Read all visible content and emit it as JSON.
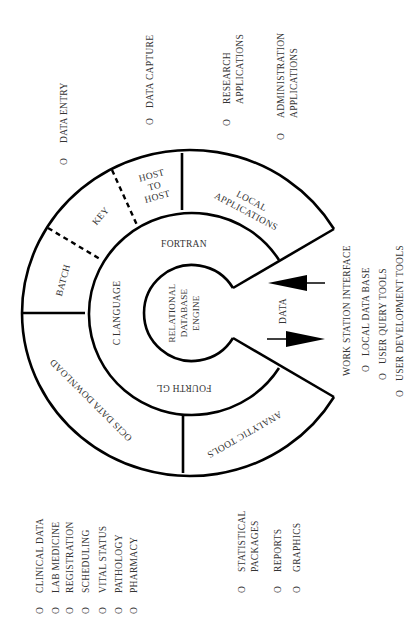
{
  "diagram": {
    "core": {
      "lines": [
        "RELATIONAL",
        "DATABASE",
        "ENGINE"
      ]
    },
    "middle_ring": {
      "fortran": "FORTRAN",
      "c_language": "C LANGUAGE",
      "fourth_gl": "FOURTH GL"
    },
    "outer_ring": {
      "batch": "BATCH",
      "key": "KEY",
      "host_to_host": [
        "HOST",
        "TO",
        "HOST"
      ],
      "local_applications": [
        "LOCAL",
        "APPLICATIONS"
      ],
      "analytic_tools": "ANALYTIC TOOLS",
      "ocis_data_download": "OCIS DATA DOWNLOAD"
    },
    "data_flow_label": "DATA"
  },
  "labels": {
    "bullet": "O",
    "top": [
      {
        "lines": [
          "DATA ENTRY"
        ]
      },
      {
        "lines": [
          "DATA CAPTURE"
        ]
      },
      {
        "lines": [
          "RESEARCH",
          "APPLICATIONS"
        ]
      },
      {
        "lines": [
          "ADMINISTRATION",
          "APPLICATIONS"
        ]
      }
    ],
    "workstation": {
      "title": "WORK STATION INTERFACE",
      "items": [
        "LOCAL DATA BASE",
        "USER QUERY TOOLS",
        "USER DEVELOPMENT TOOLS"
      ]
    },
    "ocis_sources": [
      "CLINICAL DATA",
      "LAB MEDICINE",
      "REGISTRATION",
      "SCHEDULING",
      "VITAL STATUS",
      "PATHOLOGY",
      "PHARMACY"
    ],
    "analytic": [
      {
        "lines": [
          "STATISTICAL",
          "PACKAGES"
        ]
      },
      {
        "lines": [
          "REPORTS"
        ]
      },
      {
        "lines": [
          "GRAPHICS"
        ]
      }
    ]
  },
  "colors": {
    "stroke": "#000000",
    "text": "#333333",
    "background": "#ffffff"
  }
}
